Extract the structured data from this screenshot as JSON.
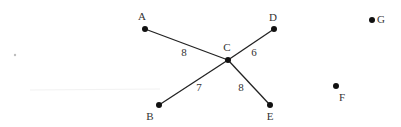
{
  "graph": {
    "nodes": [
      {
        "id": "A",
        "label": "A",
        "x": 145,
        "y": 29,
        "lx": 142,
        "ly": 20
      },
      {
        "id": "B",
        "label": "B",
        "x": 159,
        "y": 105,
        "lx": 150,
        "ly": 120
      },
      {
        "id": "C",
        "label": "C",
        "x": 228,
        "y": 60,
        "lx": 227,
        "ly": 51
      },
      {
        "id": "D",
        "label": "D",
        "x": 274,
        "y": 29,
        "lx": 273,
        "ly": 21
      },
      {
        "id": "E",
        "label": "E",
        "x": 270,
        "y": 105,
        "lx": 270,
        "ly": 120
      },
      {
        "id": "F",
        "label": "F",
        "x": 336,
        "y": 86,
        "lx": 342,
        "ly": 101
      },
      {
        "id": "G",
        "label": "G",
        "x": 372,
        "y": 20,
        "lx": 380,
        "ly": 23
      }
    ],
    "edges": [
      {
        "from": "A",
        "to": "C",
        "weight": "8",
        "wx": 184,
        "wy": 56
      },
      {
        "from": "C",
        "to": "D",
        "weight": "6",
        "wx": 254,
        "wy": 56
      },
      {
        "from": "C",
        "to": "B",
        "weight": "7",
        "wx": 199,
        "wy": 91
      },
      {
        "from": "C",
        "to": "E",
        "weight": "8",
        "wx": 241,
        "wy": 91
      }
    ]
  }
}
